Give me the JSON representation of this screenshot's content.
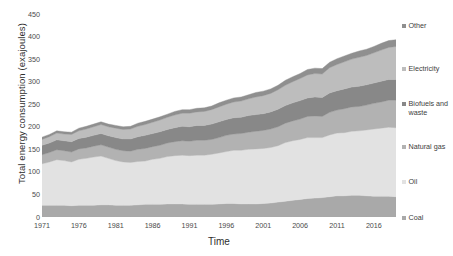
{
  "chart_data": {
    "type": "area",
    "title": "",
    "xlabel": "Time",
    "ylabel": "Total energy consumption (exajoules)",
    "xlim": [
      1971,
      2019
    ],
    "ylim": [
      0,
      450
    ],
    "grid": false,
    "legend_position": "right",
    "stacked": true,
    "ytick_labels": [
      "0",
      "50",
      "100",
      "150",
      "200",
      "250",
      "300",
      "350",
      "400",
      "450"
    ],
    "ytick_values": [
      0,
      50,
      100,
      150,
      200,
      250,
      300,
      350,
      400,
      450
    ],
    "xtick_labels": [
      "1971",
      "1976",
      "1981",
      "1986",
      "1991",
      "1996",
      "2001",
      "2006",
      "2011",
      "2016"
    ],
    "xtick_values": [
      1971,
      1976,
      1981,
      1986,
      1991,
      1996,
      2001,
      2006,
      2011,
      2016
    ],
    "x": [
      1971,
      1972,
      1973,
      1974,
      1975,
      1976,
      1977,
      1978,
      1979,
      1980,
      1981,
      1982,
      1983,
      1984,
      1985,
      1986,
      1987,
      1988,
      1989,
      1990,
      1991,
      1992,
      1993,
      1994,
      1995,
      1996,
      1997,
      1998,
      1999,
      2000,
      2001,
      2002,
      2003,
      2004,
      2005,
      2006,
      2007,
      2008,
      2009,
      2010,
      2011,
      2012,
      2013,
      2014,
      2015,
      2016,
      2017,
      2018,
      2019
    ],
    "series": [
      {
        "name": "Coal",
        "color": "#a9a9a9",
        "values": [
          26,
          26,
          26,
          26,
          25,
          26,
          26,
          26,
          27,
          27,
          26,
          26,
          26,
          27,
          28,
          28,
          28,
          29,
          29,
          29,
          28,
          28,
          28,
          28,
          29,
          30,
          30,
          29,
          29,
          29,
          30,
          31,
          33,
          35,
          37,
          39,
          41,
          42,
          43,
          45,
          47,
          47,
          48,
          48,
          47,
          46,
          46,
          46,
          45
        ]
      },
      {
        "name": "Oil",
        "color": "#e2e2e2",
        "values": [
          92,
          96,
          101,
          99,
          97,
          102,
          104,
          107,
          108,
          103,
          99,
          96,
          95,
          96,
          96,
          100,
          102,
          105,
          107,
          108,
          108,
          109,
          109,
          111,
          113,
          115,
          118,
          119,
          121,
          122,
          122,
          123,
          125,
          130,
          132,
          133,
          135,
          134,
          133,
          137,
          139,
          140,
          142,
          143,
          146,
          149,
          151,
          153,
          153
        ]
      },
      {
        "name": "Natural gas",
        "color": "#b2b2b2",
        "values": [
          20,
          21,
          22,
          22,
          22,
          23,
          23,
          24,
          25,
          25,
          25,
          25,
          25,
          27,
          28,
          28,
          29,
          30,
          31,
          32,
          32,
          33,
          33,
          33,
          34,
          36,
          36,
          37,
          38,
          39,
          40,
          41,
          42,
          43,
          44,
          45,
          47,
          48,
          47,
          50,
          51,
          53,
          54,
          54,
          55,
          57,
          58,
          60,
          61
        ]
      },
      {
        "name": "Biofuels and waste",
        "color": "#888888",
        "values": [
          21,
          21,
          22,
          22,
          23,
          23,
          24,
          24,
          25,
          25,
          26,
          26,
          27,
          28,
          29,
          29,
          30,
          30,
          31,
          32,
          32,
          33,
          33,
          34,
          35,
          35,
          36,
          36,
          37,
          37,
          37,
          38,
          39,
          39,
          40,
          41,
          41,
          42,
          42,
          43,
          43,
          44,
          44,
          45,
          45,
          45,
          46,
          46,
          46
        ]
      },
      {
        "name": "Electricity",
        "color": "#bdbdbd",
        "values": [
          13,
          14,
          15,
          15,
          16,
          17,
          18,
          19,
          20,
          20,
          21,
          21,
          22,
          23,
          24,
          25,
          26,
          27,
          28,
          29,
          30,
          30,
          31,
          32,
          33,
          34,
          35,
          36,
          37,
          39,
          40,
          41,
          43,
          45,
          47,
          49,
          51,
          52,
          52,
          56,
          58,
          60,
          62,
          64,
          65,
          67,
          69,
          71,
          73
        ]
      },
      {
        "name": "Other",
        "color": "#8f8f8f",
        "values": [
          5,
          5,
          5,
          5,
          5,
          6,
          6,
          6,
          6,
          6,
          6,
          6,
          6,
          7,
          7,
          7,
          7,
          7,
          8,
          8,
          8,
          8,
          8,
          8,
          9,
          9,
          9,
          9,
          9,
          10,
          10,
          10,
          10,
          11,
          11,
          11,
          12,
          12,
          12,
          12,
          13,
          13,
          13,
          14,
          14,
          14,
          15,
          15,
          15
        ]
      }
    ]
  }
}
